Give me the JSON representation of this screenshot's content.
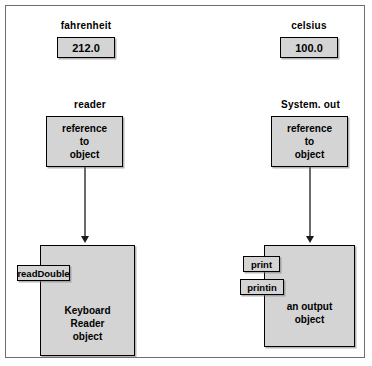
{
  "diagram": {
    "left_column": {
      "value_label": "fahrenheit",
      "value": "212.0",
      "ref_label": "reader",
      "ref_line1": "reference",
      "ref_line2": "to",
      "ref_line3": "object",
      "methods": [
        "readDouble"
      ],
      "object_line1": "Keyboard",
      "object_line2": "Reader",
      "object_line3": "object"
    },
    "right_column": {
      "value_label": "celsius",
      "value": "100.0",
      "ref_label": "System. out",
      "ref_line1": "reference",
      "ref_line2": "to",
      "ref_line3": "object",
      "methods": [
        "print",
        "printin"
      ],
      "object_line1": "an output",
      "object_line2": "object"
    },
    "colors": {
      "box_fill": "#d4d4d4",
      "box_border": "#000000",
      "frame_border": "#6e6e6e",
      "arrow": "#6a6a6a",
      "text": "#000000",
      "background": "#ffffff"
    }
  }
}
